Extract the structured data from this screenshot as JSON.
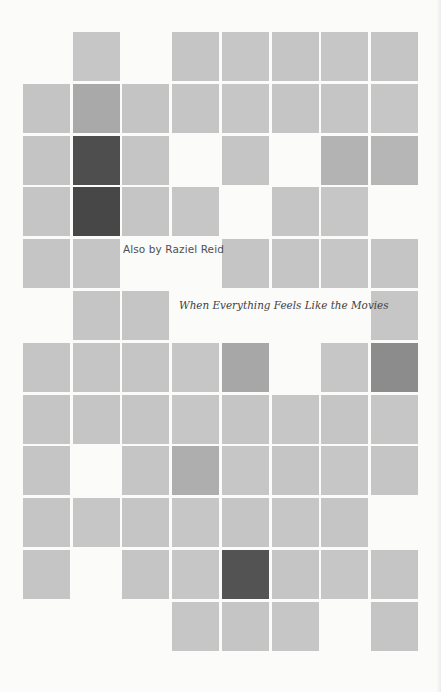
{
  "page": {
    "heading": "Also by Raziel Reid",
    "books": [
      {
        "title": "When Everything Feels Like the Movies"
      }
    ]
  },
  "palette": {
    "background": "#fbfbfa",
    "light": "#c5c5c5",
    "medium": "#a9a9a9",
    "dark": "#4b4b4b",
    "text_heading": "#505050",
    "text_title": "#404040"
  },
  "mosaic": {
    "columns": 8,
    "rows": 12,
    "origin_x": 23,
    "origin_y": 32,
    "pitch_x": 49.7,
    "pitch_y": 51.8,
    "cells": [
      [
        "",
        "#c6c6c6",
        "",
        "#c5c5c5",
        "#c6c6c6",
        "#c5c5c5",
        "#c6c6c6",
        "#c5c5c5"
      ],
      [
        "#c4c4c4",
        "#a9a9a9",
        "#c4c4c4",
        "#c5c5c5",
        "#c6c6c6",
        "#c5c5c5",
        "#c5c5c5",
        "#c6c6c6"
      ],
      [
        "#c4c4c4",
        "#4e4e4e",
        "#c5c5c5",
        "",
        "#c5c5c5",
        "",
        "#b3b3b3",
        "#b6b6b6"
      ],
      [
        "#c5c5c5",
        "#474747",
        "#c5c5c5",
        "#c6c6c6",
        "",
        "#c5c5c5",
        "#c6c6c6",
        ""
      ],
      [
        "#c5c5c5",
        "#c5c5c5",
        "",
        "",
        "#c5c5c5",
        "#c5c5c5",
        "#c6c6c6",
        "#c5c5c5"
      ],
      [
        "",
        "#c5c5c5",
        "#c5c5c5",
        "",
        "",
        "",
        "",
        "#c6c6c6"
      ],
      [
        "#c5c5c5",
        "#c5c5c5",
        "#c5c5c5",
        "#c6c6c6",
        "#a7a7a7",
        "",
        "#c6c6c6",
        "#8c8c8c"
      ],
      [
        "#c5c5c5",
        "#c5c5c5",
        "#c5c5c5",
        "#c6c6c6",
        "#c5c5c5",
        "#c6c6c6",
        "#c5c5c5",
        "#c6c6c6"
      ],
      [
        "#c5c5c5",
        "",
        "#c5c5c5",
        "#aeaeae",
        "#c6c6c6",
        "#c5c5c5",
        "#c6c6c6",
        "#c5c5c5"
      ],
      [
        "#c5c5c5",
        "#c6c6c6",
        "#c5c5c5",
        "#c6c6c6",
        "#c5c5c5",
        "#c6c6c6",
        "#c5c5c5",
        ""
      ],
      [
        "#c5c5c5",
        "",
        "#c5c5c5",
        "#c6c6c6",
        "#535353",
        "#c5c5c5",
        "#c6c6c6",
        "#c5c5c5"
      ],
      [
        "",
        "",
        "",
        "#c6c6c6",
        "#c5c5c5",
        "#c6c6c6",
        "",
        "#c5c5c5"
      ]
    ]
  }
}
